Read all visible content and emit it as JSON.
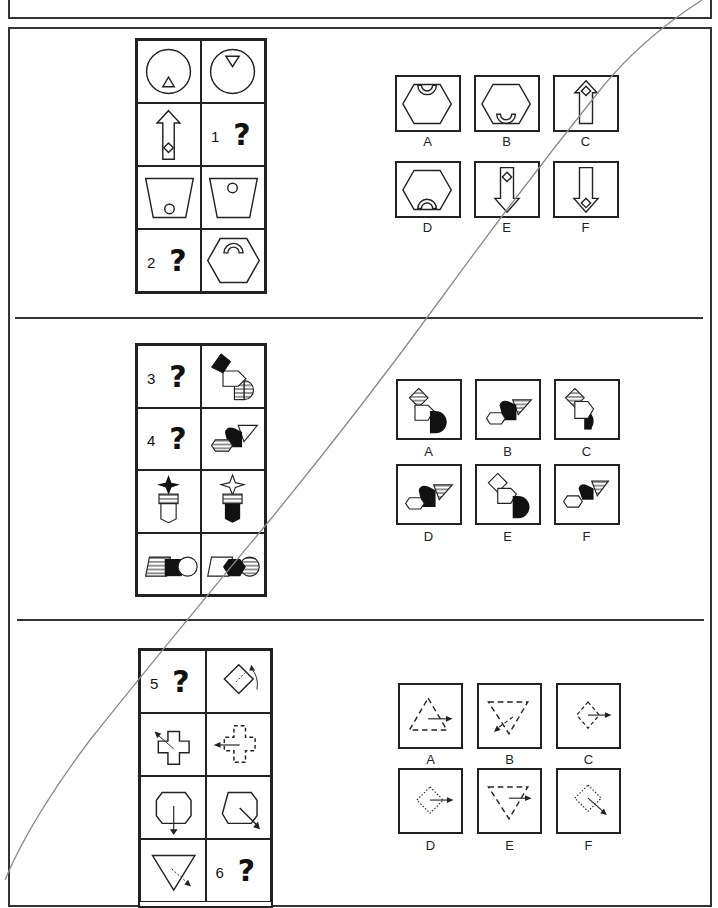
{
  "worksheet": {
    "type": "visual reasoning / analogy puzzles",
    "sections": [
      {
        "id": 1,
        "questions": [
          {
            "number": "1",
            "mark": "?"
          },
          {
            "number": "2",
            "mark": "?"
          }
        ],
        "grid": [
          [
            "circle with small triangle (bottom)",
            "circle with inverted triangle (top)"
          ],
          [
            "up arrow with diamond at bottom",
            "question 1"
          ],
          [
            "trapezoid with circle at bottom",
            "inverted trapezoid with circle at top"
          ],
          [
            "question 2",
            "hexagon with arch at top"
          ]
        ],
        "options": [
          {
            "label": "A",
            "desc": "hexagon with cup at top"
          },
          {
            "label": "B",
            "desc": "hexagon with cup at bottom"
          },
          {
            "label": "C",
            "desc": "up arrow with diamond at top"
          },
          {
            "label": "D",
            "desc": "hexagon with arch at bottom"
          },
          {
            "label": "E",
            "desc": "down arrow with diamond at top"
          },
          {
            "label": "F",
            "desc": "down arrow with diamond at bottom"
          }
        ]
      },
      {
        "id": 2,
        "questions": [
          {
            "number": "3",
            "mark": "?"
          },
          {
            "number": "4",
            "mark": "?"
          }
        ],
        "grid": [
          [
            "question 3",
            "black diamond, white pentagon, striped half-circle"
          ],
          [
            "question 4",
            "striped hexagon, black blob, white triangle"
          ],
          [
            "black star over striped bars over white shield",
            "white star over striped bars over black shield"
          ],
          [
            "striped parallelogram, black square, white circle",
            "white parallelogram, black hexagon, striped circle"
          ]
        ],
        "options": [
          {
            "label": "A",
            "desc": "striped diamond, white pentagon, black half-circle"
          },
          {
            "label": "B",
            "desc": "white hexagon, black blob, striped triangle"
          },
          {
            "label": "C",
            "desc": "striped diamond, white pentagon, black half-circle (variant)"
          },
          {
            "label": "D",
            "desc": "white hexagon, black blob, striped triangle (variant)"
          },
          {
            "label": "E",
            "desc": "white diamond, white pentagon, black half-circle"
          },
          {
            "label": "F",
            "desc": "white hexagon, black blob, striped triangle (small)"
          }
        ]
      },
      {
        "id": 3,
        "questions": [
          {
            "number": "5",
            "mark": "?"
          },
          {
            "number": "6",
            "mark": "?"
          }
        ],
        "grid": [
          [
            "question 5",
            "rotated square with curved arrow"
          ],
          [
            "cross with arrow up-left",
            "dashed cross with arrow left"
          ],
          [
            "octagon-ish with arrow down",
            "octagon-ish with arrow down-right"
          ],
          [
            "inverted triangle with arrow down-right",
            "question 6"
          ]
        ],
        "options": [
          {
            "label": "A",
            "desc": "dashed triangle, arrow right"
          },
          {
            "label": "B",
            "desc": "dashed inverted triangle, arrow down-left"
          },
          {
            "label": "C",
            "desc": "dashed diamond, arrow right"
          },
          {
            "label": "D",
            "desc": "dotted diamond, arrow right"
          },
          {
            "label": "E",
            "desc": "dashed inverted triangle, arrow right"
          },
          {
            "label": "F",
            "desc": "dotted rotated square, arrow down-right"
          }
        ]
      }
    ]
  },
  "labels": {
    "q1": "1",
    "q2": "2",
    "q3": "3",
    "q4": "4",
    "q5": "5",
    "q6": "6",
    "qmark": "?",
    "A": "A",
    "B": "B",
    "C": "C",
    "D": "D",
    "E": "E",
    "F": "F"
  }
}
